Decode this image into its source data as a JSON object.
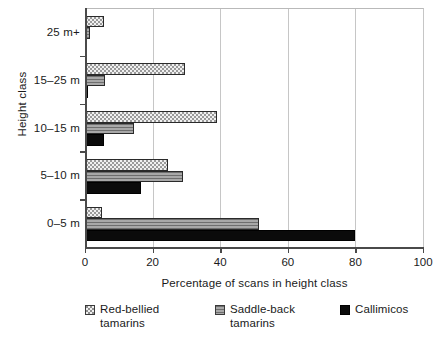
{
  "chart_data": {
    "type": "bar",
    "orientation": "horizontal",
    "title": "",
    "xlabel": "Percentage of scans in height class",
    "ylabel": "Height class",
    "categories": [
      "0–5 m",
      "5–10 m",
      "10–15 m",
      "15–25 m",
      "25 m+"
    ],
    "categories_top_to_bottom": [
      "25 m+",
      "15–25 m",
      "10–15 m",
      "5–10 m",
      "0–5 m"
    ],
    "xlim": [
      0,
      100
    ],
    "xticks": [
      0,
      20,
      40,
      60,
      80,
      100
    ],
    "xtick_labels": [
      "0",
      "20",
      "40",
      "60",
      "80",
      "100"
    ],
    "grid": "vertical",
    "legend_position": "below",
    "series": [
      {
        "name": "Red-bellied tamarins",
        "legend_label": "Red-bellied\ntamarins",
        "pattern": "stippled",
        "values": [
          5,
          24.5,
          39,
          29.5,
          5.5
        ]
      },
      {
        "name": "Saddle-back tamarins",
        "legend_label": "Saddle-back\ntamarins",
        "pattern": "gray-horizontal-lines",
        "values": [
          51.5,
          29,
          14.5,
          6,
          1.5
        ]
      },
      {
        "name": "Callimicos",
        "legend_label": "Callimicos",
        "pattern": "solid-black",
        "values": [
          80,
          16.5,
          5.5,
          1,
          0
        ]
      }
    ]
  },
  "colors": {
    "axis": "#4a4a4a",
    "grid": "#c6c6c6",
    "frame": "#b9b9b9",
    "series_0": "#f0f0f0",
    "series_1": "#8d8d8d",
    "series_2": "#0b0b0b",
    "text": "#1a1a1a",
    "background": "#ffffff"
  }
}
